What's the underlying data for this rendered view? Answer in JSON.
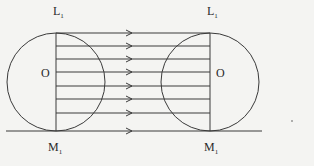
{
  "diagram": {
    "labels": {
      "top_left": {
        "main": "L",
        "sub": "1"
      },
      "top_right": {
        "main": "L",
        "sub": "1"
      },
      "center_left": "O",
      "center_right": "O",
      "bottom_left": {
        "main": "M",
        "sub": "1"
      },
      "bottom_right": {
        "main": "M",
        "sub": "1"
      }
    },
    "parallel_lines_count": 8,
    "arrow_direction": "right",
    "colors": {
      "line": "#3a3a3a",
      "background": "#f4f4f2"
    }
  }
}
